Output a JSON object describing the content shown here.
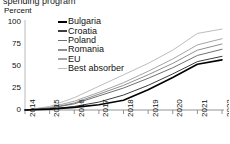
{
  "title_partial": "spending program",
  "axis": {
    "y_label": "Percent",
    "y_ticks": [
      "100",
      "75",
      "50",
      "25",
      "0"
    ],
    "x_ticks": [
      "2014",
      "2015",
      "2016",
      "2017",
      "2018",
      "2019",
      "2020",
      "2021",
      "2022"
    ]
  },
  "legend": {
    "items": [
      {
        "label": "Bulgaria",
        "color": "#000000"
      },
      {
        "label": "Croatia",
        "color": "#3d3d3d"
      },
      {
        "label": "Poland",
        "color": "#707070"
      },
      {
        "label": "Romania",
        "color": "#8f8f8f"
      },
      {
        "label": "EU",
        "color": "#a5a5a5"
      },
      {
        "label": "Best absorber",
        "color": "#bdbdbd"
      }
    ]
  },
  "chart_data": {
    "type": "line",
    "title": "spending program",
    "xlabel": "",
    "ylabel": "Percent",
    "ylim": [
      0,
      100
    ],
    "xlim": [
      "2014",
      "2022"
    ],
    "grid": false,
    "legend_position": "inside-top-left",
    "x": [
      "2014",
      "2015",
      "2016",
      "2017",
      "2018",
      "2019",
      "2020",
      "2021",
      "2022"
    ],
    "series": [
      {
        "name": "Bulgaria",
        "color": "#000000",
        "values": [
          0,
          1,
          3,
          6,
          11,
          23,
          37,
          52,
          57
        ]
      },
      {
        "name": "Croatia",
        "color": "#3d3d3d",
        "values": [
          0,
          1,
          4,
          9,
          17,
          28,
          41,
          55,
          61
        ]
      },
      {
        "name": "Poland",
        "color": "#707070",
        "values": [
          0,
          2,
          7,
          16,
          25,
          36,
          48,
          62,
          69
        ]
      },
      {
        "name": "Romania",
        "color": "#8f8f8f",
        "values": [
          0,
          2,
          8,
          18,
          28,
          40,
          53,
          68,
          75
        ]
      },
      {
        "name": "EU",
        "color": "#a5a5a5",
        "values": [
          0,
          3,
          10,
          20,
          31,
          44,
          58,
          74,
          81
        ]
      },
      {
        "name": "Best absorber",
        "color": "#bdbdbd",
        "values": [
          0,
          4,
          14,
          27,
          40,
          53,
          68,
          87,
          92
        ]
      }
    ]
  }
}
